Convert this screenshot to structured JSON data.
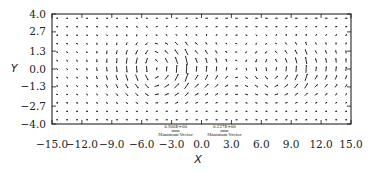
{
  "chart_data": {
    "type": "quiver",
    "title": "",
    "xlabel": "X",
    "ylabel": "Y",
    "xlim": [
      -15.0,
      15.0
    ],
    "ylim": [
      -4.0,
      4.0
    ],
    "xticks": [
      "-15.0",
      "-12.0",
      "-9.0",
      "-6.0",
      "-3.0",
      "0.0",
      "3.0",
      "6.0",
      "9.0",
      "12.0",
      "15.0"
    ],
    "yticks": [
      "4.0",
      "2.7",
      "1.3",
      "0.0",
      "-1.3",
      "-2.7",
      "-4.0"
    ],
    "grid": false,
    "reference_vectors": [
      {
        "value": "0.500E+00",
        "label": "Maximum Vector"
      },
      {
        "value": "0.227E+00",
        "label": "Maximum Vector"
      }
    ],
    "field": {
      "nx": 30,
      "ny": 13,
      "vortex_centers_x": [
        -3.0,
        9.0
      ],
      "vortex_center_y": 0.0
    }
  }
}
